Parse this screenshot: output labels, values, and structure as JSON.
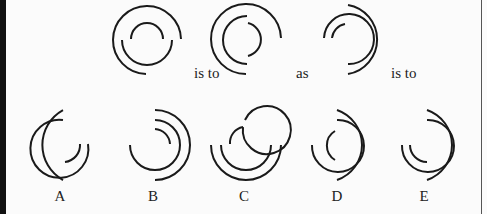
{
  "question": {
    "connector_1": "is to",
    "connector_2": "as",
    "connector_3": "is to"
  },
  "options": [
    {
      "label": "A"
    },
    {
      "label": "B"
    },
    {
      "label": "C"
    },
    {
      "label": "D"
    },
    {
      "label": "E"
    }
  ],
  "colors": {
    "stroke": "#1a1a1a",
    "background": "#fbfbfb"
  }
}
